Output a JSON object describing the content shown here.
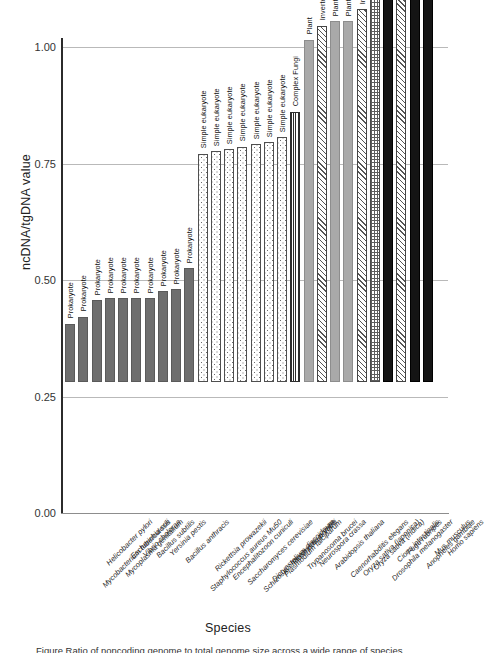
{
  "chart_data": {
    "type": "bar",
    "title": "",
    "xlabel": "Species",
    "ylabel": "ncDNA/tgDNA value",
    "ylim": [
      0.0,
      1.0
    ],
    "yticks": [
      "0.00",
      "0.25",
      "0.50",
      "0.75",
      "1.00"
    ],
    "ytick_values": [
      0.0,
      0.25,
      0.5,
      0.75,
      1.0
    ],
    "grid": true,
    "legend_position": "none",
    "group_annotation_note": "Each bar is annotated above with its organism group",
    "categories": [
      "Mycobacterium tuberculosis",
      "Helicobacter pylori",
      "Mycoplasma genitalium",
      "Escherichia coli",
      "Vibrio cholerae",
      "Bacillus subtilis",
      "Yersinia pestis",
      "Bacillus anthracis",
      "Staphylococcus aureus Mu50",
      "Rickettsia prowazekii",
      "Encephalitozoon cuniculi",
      "Saccharomyces cerevisiae",
      "Schizosaccharomyces pombe",
      "Dictyostelium discoideum",
      "Plasmodium falciparum",
      "Plasmodium yoelii",
      "Trypanosoma brucei",
      "Neurospora crassa",
      "Arabidopsis thaliana",
      "Caenorhabditis elegans",
      "Oryza sativa (japonica)",
      "Oryza sativa (indica)",
      "Drosophila melanogaster",
      "Ciona intestinalis",
      "Fugu rubripes",
      "Anopheles gambiae",
      "Mus musculus",
      "Homo sapiens"
    ],
    "values": [
      0.125,
      0.14,
      0.175,
      0.18,
      0.18,
      0.18,
      0.18,
      0.195,
      0.2,
      0.245,
      0.49,
      0.495,
      0.5,
      0.505,
      0.51,
      0.515,
      0.525,
      0.58,
      0.735,
      0.765,
      0.775,
      0.775,
      0.8,
      0.875,
      0.885,
      0.925,
      0.96,
      0.985
    ],
    "group_labels": [
      "Prokaryote",
      "Prokaryote",
      "Prokaryote",
      "Prokaryote",
      "Prokaryote",
      "Prokaryote",
      "Prokaryote",
      "Prokaryote",
      "Prokaryote",
      "Prokaryote",
      "Simple eukaryote",
      "Simple eukaryote",
      "Simple eukaryote",
      "Simple eukaryote",
      "Simple eukaryote",
      "Simple eukaryote",
      "Simple eukaryote",
      "Complex Fungi",
      "Plant",
      "Invertebrate",
      "Plant",
      "Plant",
      "Invertebrate",
      "Urochordate",
      "Vertebrate",
      "Invertebrate",
      "Vertebrate",
      "Vertebrate"
    ],
    "group_patterns": [
      "prokaryote",
      "prokaryote",
      "prokaryote",
      "prokaryote",
      "prokaryote",
      "prokaryote",
      "prokaryote",
      "prokaryote",
      "prokaryote",
      "prokaryote",
      "simple-eukaryote",
      "simple-eukaryote",
      "simple-eukaryote",
      "simple-eukaryote",
      "simple-eukaryote",
      "simple-eukaryote",
      "simple-eukaryote",
      "complex-fungi",
      "plant",
      "invertebrate",
      "plant",
      "plant",
      "invertebrate",
      "urochordate",
      "vertebrate",
      "invertebrate",
      "vertebrate",
      "vertebrate"
    ],
    "colors": {
      "prokaryote": "#6e6e6e",
      "simple_eukaryote": "#ffffff",
      "complex_fungi": "#2e2e2e",
      "plant": "#a9a9a9",
      "invertebrate": "#555555",
      "urochordate": "#5d5d5d",
      "vertebrate": "#141414",
      "gridline": "#b9b9b9",
      "axis": "#2b2b2b"
    }
  },
  "caption": {
    "text": "Figure   Ratio of noncoding genome to total genome size across a wide range of species"
  }
}
